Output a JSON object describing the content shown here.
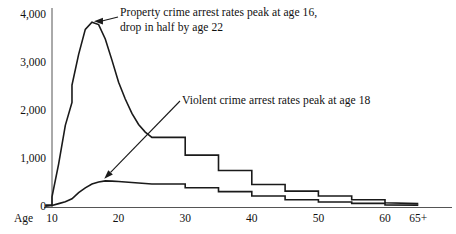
{
  "chart_data": {
    "type": "line",
    "title": "",
    "xlabel": "Age",
    "ylabel": "",
    "xlim": [
      9,
      66
    ],
    "ylim": [
      0,
      4200
    ],
    "grid": false,
    "legend": "none",
    "y_ticks": [
      "0",
      "1,000",
      "2,000",
      "3,000",
      "4,000"
    ],
    "y_tick_values": [
      0,
      1000,
      2000,
      3000,
      4000
    ],
    "x_ticks": [
      "10",
      "20",
      "30",
      "40",
      "50",
      "60",
      "65+"
    ],
    "x_tick_values": [
      10,
      20,
      30,
      40,
      50,
      60,
      65
    ],
    "series": [
      {
        "name": "Property crime arrest rates",
        "x": [
          9,
          10,
          10,
          11,
          12,
          13,
          13,
          14,
          15,
          16,
          17,
          18,
          19,
          20,
          21,
          22,
          23,
          24,
          25,
          25,
          30,
          30,
          35,
          35,
          40,
          40,
          45,
          45,
          50,
          50,
          55,
          55,
          60,
          60,
          65
        ],
        "values": [
          40,
          40,
          210,
          900,
          1700,
          2180,
          2540,
          3180,
          3700,
          3850,
          3800,
          3500,
          3060,
          2600,
          2250,
          1950,
          1720,
          1560,
          1450,
          1450,
          1450,
          1080,
          1080,
          760,
          760,
          470,
          470,
          330,
          330,
          230,
          230,
          150,
          150,
          90,
          70
        ]
      },
      {
        "name": "Violent crime arrest rates",
        "x": [
          9,
          10,
          11,
          12,
          13,
          14,
          15,
          16,
          17,
          18,
          19,
          20,
          21,
          22,
          23,
          24,
          25,
          25,
          30,
          30,
          35,
          35,
          40,
          40,
          45,
          45,
          50,
          50,
          55,
          55,
          60,
          60,
          65
        ],
        "values": [
          15,
          30,
          70,
          110,
          170,
          300,
          400,
          480,
          520,
          545,
          540,
          530,
          520,
          510,
          500,
          490,
          480,
          480,
          480,
          400,
          400,
          320,
          320,
          230,
          230,
          150,
          150,
          105,
          105,
          75,
          75,
          45,
          40
        ]
      }
    ],
    "annotations": [
      {
        "id": "property",
        "text": "Property crime arrest rates peak at age 16,\ndrop in half by age 22",
        "points_to_age": 16,
        "points_to_value": 3850
      },
      {
        "id": "violent",
        "text": "Violent crime arrest rates peak at age 18",
        "points_to_age": 18,
        "points_to_value": 545
      }
    ],
    "colors": {
      "line": "#1a1a1a",
      "axis": "#555555",
      "background": "#ffffff",
      "text": "#111111"
    }
  }
}
